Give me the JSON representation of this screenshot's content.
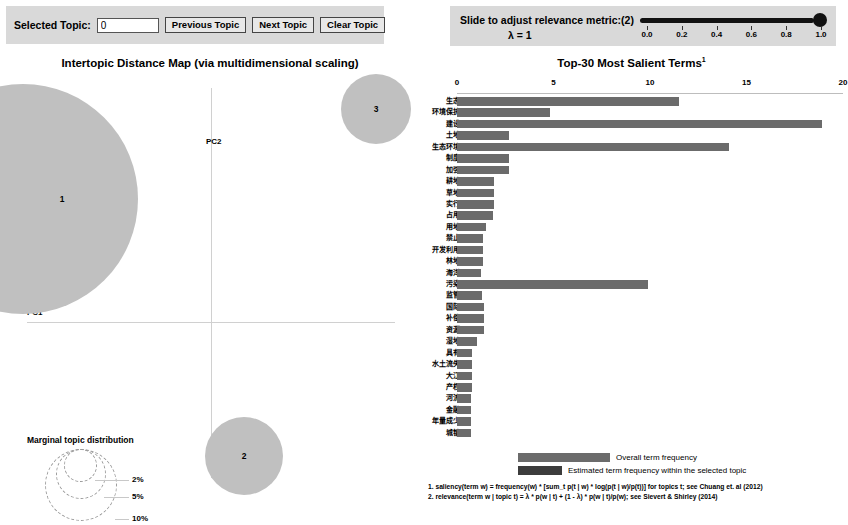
{
  "controls": {
    "selected_topic_label": "Selected Topic:",
    "selected_topic_value": "0",
    "previous_topic_label": "Previous Topic",
    "next_topic_label": "Next Topic",
    "clear_topic_label": "Clear Topic"
  },
  "relevance": {
    "label": "Slide to adjust relevance metric:",
    "superscript": "(2)",
    "lambda_label": "λ = 1",
    "lambda_value": 1.0,
    "ticks": [
      "0.0",
      "0.2",
      "0.4",
      "0.6",
      "0.8",
      "1.0"
    ]
  },
  "intertopic": {
    "title": "Intertopic Distance Map (via multidimensional scaling)",
    "axis_x_label": "PC1",
    "axis_y_label": "PC2",
    "topics": [
      {
        "id": "1",
        "label": "1"
      },
      {
        "id": "2",
        "label": "2"
      },
      {
        "id": "3",
        "label": "3"
      }
    ],
    "marginal_legend": {
      "title": "Marginal topic distribution",
      "percents": [
        "2%",
        "5%",
        "10%"
      ]
    }
  },
  "barchart": {
    "title": "Top-30 Most Salient Terms",
    "title_superscript": "1",
    "legend_overall": "Overall term frequency",
    "legend_estimated": "Estimated term frequency within the selected topic",
    "footnote1": "1. saliency(term w) = frequency(w) * [sum_t p(t | w) * log(p(t | w)/p(t))] for topics t; see Chuang et. al (2012)",
    "footnote2": "2. relevance(term w | topic t) = λ * p(w | t) + (1 - λ) * p(w | t)/p(w); see Sievert & Shirley (2014)"
  },
  "colors": {
    "panel": "#d9d9d9",
    "topic_circle": "#c0c0c0",
    "bar_overall": "#6b6b6b",
    "bar_estimated": "#3c3c3c"
  },
  "chart_data": {
    "type": "bar",
    "title": "Top-30 Most Salient Terms",
    "xlabel": "",
    "ylabel": "",
    "xlim": [
      0,
      20
    ],
    "xticks": [
      0,
      5,
      10,
      15,
      20
    ],
    "grid": false,
    "orientation": "horizontal",
    "legend_position": "bottom",
    "categories": [
      "生态",
      "环境保护",
      "建设",
      "土地",
      "生态环境",
      "制度",
      "加强",
      "耕地",
      "草地",
      "实行",
      "占用",
      "用地",
      "禁止",
      "开发利用",
      "林地",
      "海洋",
      "污染",
      "监管",
      "国际",
      "补偿",
      "资源",
      "湿地",
      "具有",
      "水土流失",
      "大江",
      "产权",
      "河流",
      "金融",
      "年量成少",
      "城镇"
    ],
    "series": [
      {
        "name": "Overall term frequency",
        "values": [
          11.5,
          4.8,
          18.9,
          2.7,
          14.1,
          2.7,
          2.7,
          1.9,
          1.9,
          1.9,
          1.85,
          1.5,
          1.35,
          1.35,
          1.35,
          1.25,
          9.9,
          1.3,
          1.4,
          1.4,
          1.4,
          1.05,
          0.8,
          0.8,
          0.8,
          0.8,
          0.75,
          0.75,
          0.75,
          0.75
        ]
      },
      {
        "name": "Estimated term frequency within the selected topic",
        "values": [
          0,
          0,
          0,
          0,
          0,
          0,
          0,
          0,
          0,
          0,
          0,
          0,
          0,
          0,
          0,
          0,
          0,
          0,
          0,
          0,
          0,
          0,
          0,
          0,
          0,
          0,
          0,
          0,
          0,
          0
        ]
      }
    ]
  }
}
